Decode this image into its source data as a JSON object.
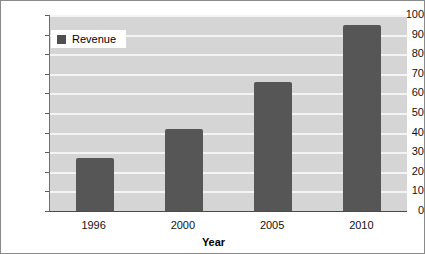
{
  "chart_data": {
    "type": "bar",
    "title": "",
    "subtitle": "",
    "xlabel": "Year",
    "ylabel": "",
    "categories": [
      "1996",
      "2000",
      "2005",
      "2010"
    ],
    "values": [
      27,
      42,
      66,
      95
    ],
    "series": [
      {
        "name": "Revenue",
        "values": [
          27,
          42,
          66,
          95
        ]
      }
    ],
    "ylim": [
      0,
      100
    ],
    "y_ticks": [
      0,
      10,
      20,
      30,
      40,
      50,
      60,
      70,
      80,
      90,
      100
    ],
    "y_tick_labels": [
      "0",
      "10",
      "20",
      "30",
      "40",
      "50",
      "60",
      "70",
      "80",
      "90",
      "100"
    ],
    "grid": true,
    "grid_orientation": "horizontal",
    "legend": [
      "Revenue"
    ],
    "legend_position": "top-left-inside",
    "colors": {
      "bar": "#565656",
      "plot_background": "#d5d5d5",
      "gridline": "#f4f4f4",
      "axis": "#4a4a4a",
      "text": "#111111",
      "legend_background": "#ffffff",
      "frame_border": "#8a8a8a"
    }
  },
  "legend": {
    "swatch_name": "legend-color-swatch",
    "label": "Revenue"
  },
  "axes": {
    "x_title": "Year"
  }
}
